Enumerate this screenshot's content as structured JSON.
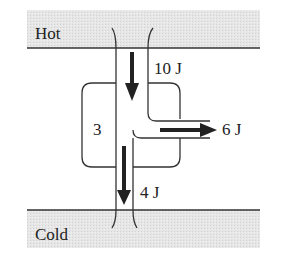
{
  "diagram": {
    "reservoirs": {
      "hot": {
        "label": "Hot"
      },
      "cold": {
        "label": "Cold"
      }
    },
    "engine": {
      "label": "3"
    },
    "flows": {
      "heat_in": {
        "label": "10 J",
        "direction": "down"
      },
      "work_out": {
        "label": "6 J",
        "direction": "right"
      },
      "heat_out": {
        "label": "4 J",
        "direction": "down"
      }
    },
    "colors": {
      "reservoir_fill": "#e4e4e4",
      "line": "#333333",
      "arrow": "#222222"
    }
  }
}
